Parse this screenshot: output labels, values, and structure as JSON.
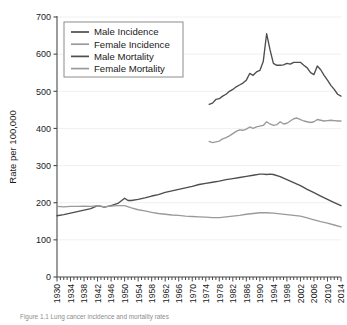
{
  "figure": {
    "caption": "Figure 1.1  Lung cancer incidence and mortality rates",
    "background": "#ffffff"
  },
  "colors": {
    "dark_series": "#4d4d4d",
    "light_series": "#9a9a9a",
    "axis": "#4a4a4a",
    "grid": "#f0f0f0",
    "text": "#1a1a1a",
    "legend_border": "#8c8c8c"
  },
  "legend": {
    "position": "top-left",
    "entries": [
      {
        "label": "Male Incidence",
        "color": "#4d4d4d"
      },
      {
        "label": "Female Incidence",
        "color": "#9a9a9a"
      },
      {
        "label": "Male Mortality",
        "color": "#4d4d4d"
      },
      {
        "label": "Female Mortality",
        "color": "#9a9a9a"
      }
    ]
  },
  "chart_data": {
    "type": "line",
    "title": "",
    "xlabel": "",
    "ylabel": "Rate per 100,000",
    "xlim": [
      1930,
      2014
    ],
    "ylim": [
      0,
      700
    ],
    "yticks": [
      0,
      100,
      200,
      300,
      400,
      500,
      600,
      700
    ],
    "ytick_labels": [
      "0",
      "100",
      "200",
      "300",
      "400",
      "500",
      "600",
      "700"
    ],
    "xticks": [
      1930,
      1934,
      1938,
      1942,
      1946,
      1950,
      1954,
      1958,
      1962,
      1966,
      1970,
      1974,
      1978,
      1982,
      1986,
      1990,
      1994,
      1998,
      2002,
      2006,
      2010,
      2014
    ],
    "xtick_labels": [
      "1930",
      "1934",
      "1938",
      "1942",
      "1946",
      "1950",
      "1954",
      "1958",
      "1962",
      "1966",
      "1970",
      "1974",
      "1978",
      "1982",
      "1986",
      "1990",
      "1994",
      "1998",
      "2002",
      "2006",
      "2010",
      "2014"
    ],
    "xminor_step": 1,
    "grid": "horizontal-faint",
    "legend_position": "upper-left",
    "series": [
      {
        "name": "Male Incidence",
        "color": "#4d4d4d",
        "x": [
          1975,
          1976,
          1977,
          1978,
          1979,
          1980,
          1981,
          1982,
          1983,
          1984,
          1985,
          1986,
          1987,
          1988,
          1989,
          1990,
          1991,
          1992,
          1993,
          1994,
          1995,
          1996,
          1997,
          1998,
          1999,
          2000,
          2001,
          2002,
          2003,
          2004,
          2005,
          2006,
          2007,
          2008,
          2009,
          2010,
          2011,
          2012,
          2013,
          2014
        ],
        "values": [
          465,
          468,
          478,
          480,
          487,
          492,
          500,
          505,
          512,
          517,
          522,
          530,
          548,
          543,
          552,
          556,
          580,
          655,
          612,
          575,
          570,
          570,
          571,
          575,
          573,
          578,
          578,
          578,
          570,
          563,
          550,
          545,
          568,
          558,
          543,
          530,
          516,
          505,
          492,
          487
        ]
      },
      {
        "name": "Female Incidence",
        "color": "#9a9a9a",
        "x": [
          1975,
          1976,
          1977,
          1978,
          1979,
          1980,
          1981,
          1982,
          1983,
          1984,
          1985,
          1986,
          1987,
          1988,
          1989,
          1990,
          1991,
          1992,
          1993,
          1994,
          1995,
          1996,
          1997,
          1998,
          1999,
          2000,
          2001,
          2002,
          2003,
          2004,
          2005,
          2006,
          2007,
          2008,
          2009,
          2010,
          2011,
          2012,
          2013,
          2014
        ],
        "values": [
          365,
          362,
          364,
          366,
          372,
          375,
          380,
          386,
          392,
          396,
          395,
          398,
          404,
          400,
          404,
          406,
          408,
          418,
          412,
          408,
          410,
          418,
          412,
          414,
          420,
          426,
          428,
          424,
          420,
          418,
          416,
          418,
          424,
          422,
          420,
          421,
          422,
          421,
          420,
          420
        ]
      },
      {
        "name": "Male Mortality",
        "color": "#4d4d4d",
        "x": [
          1930,
          1932,
          1934,
          1936,
          1938,
          1940,
          1942,
          1944,
          1946,
          1948,
          1950,
          1951,
          1952,
          1954,
          1956,
          1958,
          1960,
          1962,
          1964,
          1966,
          1968,
          1970,
          1972,
          1974,
          1976,
          1978,
          1980,
          1982,
          1984,
          1986,
          1988,
          1990,
          1991,
          1992,
          1993,
          1994,
          1996,
          1998,
          2000,
          2002,
          2004,
          2006,
          2008,
          2010,
          2012,
          2014
        ],
        "values": [
          165,
          168,
          172,
          176,
          180,
          184,
          192,
          188,
          192,
          198,
          212,
          206,
          206,
          209,
          213,
          218,
          222,
          228,
          232,
          236,
          240,
          244,
          249,
          252,
          255,
          258,
          262,
          265,
          268,
          271,
          274,
          277,
          277,
          276,
          277,
          276,
          270,
          262,
          254,
          246,
          236,
          227,
          218,
          209,
          200,
          192
        ]
      },
      {
        "name": "Female Mortality",
        "color": "#9a9a9a",
        "x": [
          1930,
          1932,
          1934,
          1936,
          1938,
          1940,
          1942,
          1944,
          1946,
          1948,
          1950,
          1952,
          1954,
          1956,
          1958,
          1960,
          1962,
          1964,
          1966,
          1968,
          1970,
          1972,
          1974,
          1976,
          1978,
          1980,
          1982,
          1984,
          1986,
          1988,
          1990,
          1992,
          1994,
          1996,
          1998,
          2000,
          2002,
          2004,
          2006,
          2008,
          2010,
          2012,
          2014
        ],
        "values": [
          190,
          189,
          190,
          190,
          191,
          190,
          192,
          189,
          191,
          192,
          192,
          186,
          181,
          178,
          174,
          171,
          169,
          167,
          166,
          164,
          163,
          162,
          161,
          160,
          160,
          162,
          164,
          166,
          169,
          171,
          173,
          173,
          172,
          170,
          168,
          166,
          164,
          159,
          154,
          149,
          145,
          140,
          135
        ]
      }
    ]
  }
}
